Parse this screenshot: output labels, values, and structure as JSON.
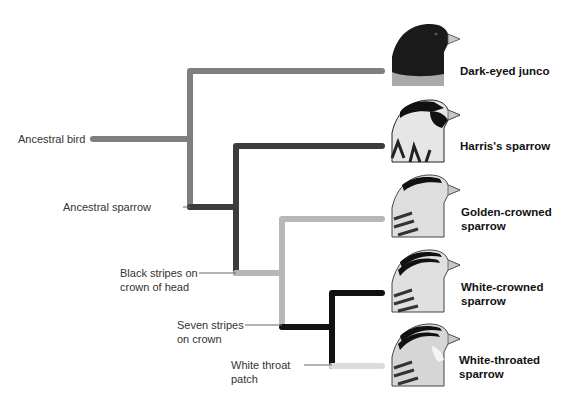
{
  "diagram": {
    "type": "phylogenetic-tree",
    "colors": {
      "ancestral": "#7f7f7f",
      "sparrow": "#3c3c3c",
      "black_stripes": "#b7b7b7",
      "seven_stripes": "#111111",
      "white_throat": "#dcdcdc",
      "connector": "#666666"
    },
    "node_labels": {
      "ancestral_bird": "Ancestral bird",
      "ancestral_sparrow": "Ancestral sparrow",
      "black_stripes_1": "Black stripes on",
      "black_stripes_2": "crown of head",
      "seven_stripes_1": "Seven stripes",
      "seven_stripes_2": "on crown",
      "white_throat_1": "White throat",
      "white_throat_2": "patch"
    },
    "species": [
      {
        "line1": "Dark-eyed junco",
        "line2": "",
        "icon": "bird-head-dark-eyed-junco"
      },
      {
        "line1": "Harris's sparrow",
        "line2": "",
        "icon": "bird-head-harris-sparrow"
      },
      {
        "line1": "Golden-crowned",
        "line2": "sparrow",
        "icon": "bird-head-golden-crowned-sparrow"
      },
      {
        "line1": "White-crowned",
        "line2": "sparrow",
        "icon": "bird-head-white-crowned-sparrow"
      },
      {
        "line1": "White-throated",
        "line2": "sparrow",
        "icon": "bird-head-white-throated-sparrow"
      }
    ]
  }
}
